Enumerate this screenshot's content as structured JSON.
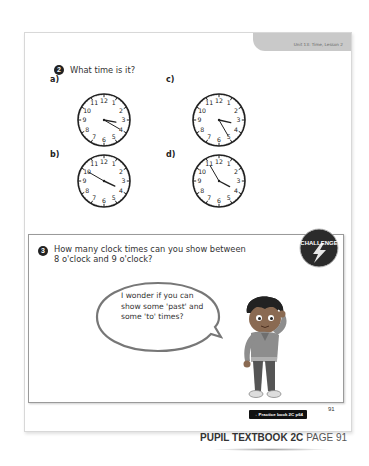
{
  "header": {
    "unit_tab": "Unit 13: Time, Lesson 2"
  },
  "question2": {
    "number": "2",
    "prompt": "What time is it?",
    "clocks": [
      {
        "label": "a)",
        "hour": 3,
        "minute": 20
      },
      {
        "label": "c)",
        "hour": 3,
        "minute": 25
      },
      {
        "label": "b)",
        "hour": 3,
        "minute": 50
      },
      {
        "label": "d)",
        "hour": 3,
        "minute": 55
      }
    ],
    "clock_numerals": [
      "12",
      "1",
      "2",
      "3",
      "4",
      "5",
      "6",
      "7",
      "8",
      "9",
      "10",
      "11"
    ]
  },
  "question3": {
    "number": "3",
    "prompt_line1": "How many clock times can you show between",
    "prompt_line2": "8 o'clock and 9 o'clock?",
    "badge": "CHALLENGE",
    "speech_line1": "I wonder if you can",
    "speech_line2": "show some 'past' and",
    "speech_line3": "some 'to' times?"
  },
  "footer": {
    "practice_link": "→ Practice book 2C p64",
    "page_number": "91",
    "book_title": "PUPIL TEXTBOOK 2C",
    "page_label": "PAGE 91"
  },
  "colors": {
    "tab_gray": "#c9c9c9",
    "number_circle": "#222222",
    "badge_dark": "#2b2b2b"
  }
}
